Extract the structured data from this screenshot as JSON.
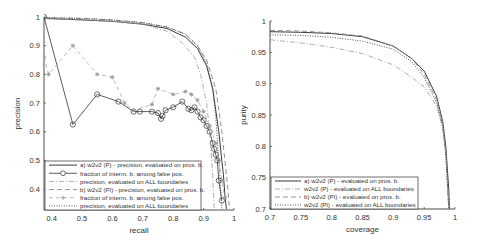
{
  "chart_data": [
    {
      "type": "line",
      "title": "",
      "xlabel": "recall",
      "ylabel": "precision",
      "xlim": [
        0.375,
        1.0
      ],
      "ylim": [
        0.327,
        1.0
      ],
      "xticks": [
        "0.4",
        "0.5",
        "0.6",
        "0.7",
        "0.8",
        "0.9",
        "1"
      ],
      "yticks": [
        "0.4",
        "0.5",
        "0.6",
        "0.7",
        "0.8",
        "0.9",
        "1"
      ],
      "grid": false,
      "legend_position": "lower left",
      "series": [
        {
          "name": "a) w2v2 (P) - precision, evaluated on pros. b.",
          "style": "solid",
          "x": [
            0.375,
            0.5,
            0.6,
            0.7,
            0.78,
            0.84,
            0.88,
            0.91,
            0.93,
            0.95,
            0.96,
            0.965,
            0.97,
            0.975
          ],
          "y": [
            0.995,
            0.99,
            0.985,
            0.975,
            0.96,
            0.93,
            0.89,
            0.83,
            0.75,
            0.6,
            0.5,
            0.45,
            0.38,
            0.33
          ]
        },
        {
          "name": "fraction of interm. b. among false pos.",
          "style": "solid-circle",
          "x": [
            0.375,
            0.47,
            0.55,
            0.62,
            0.67,
            0.69,
            0.73,
            0.75,
            0.76,
            0.765,
            0.775,
            0.8,
            0.83,
            0.85,
            0.86,
            0.87,
            0.88,
            0.89,
            0.9,
            0.91,
            0.92,
            0.93,
            0.935,
            0.94,
            0.945,
            0.95,
            0.96
          ],
          "y": [
            1.0,
            0.625,
            0.73,
            0.705,
            0.67,
            0.67,
            0.67,
            0.665,
            0.645,
            0.655,
            0.675,
            0.685,
            0.705,
            0.68,
            0.675,
            0.685,
            0.67,
            0.65,
            0.64,
            0.62,
            0.6,
            0.56,
            0.54,
            0.52,
            0.5,
            0.43,
            0.36
          ]
        },
        {
          "name": "precision, evaluated on ALL boundaries",
          "style": "dash-dot",
          "x": [
            0.375,
            0.5,
            0.6,
            0.7,
            0.78,
            0.83,
            0.87,
            0.89,
            0.91,
            0.92,
            0.93,
            0.935
          ],
          "y": [
            0.995,
            0.99,
            0.985,
            0.975,
            0.95,
            0.91,
            0.86,
            0.8,
            0.7,
            0.6,
            0.45,
            0.33
          ]
        },
        {
          "name": "b) w2v2 (PI) - precision, evaluated on pros. b.",
          "style": "dashed",
          "x": [
            0.375,
            0.5,
            0.6,
            0.7,
            0.78,
            0.84,
            0.88,
            0.91,
            0.94,
            0.96,
            0.97,
            0.98,
            0.985
          ],
          "y": [
            0.998,
            0.995,
            0.99,
            0.98,
            0.965,
            0.94,
            0.9,
            0.85,
            0.75,
            0.6,
            0.5,
            0.4,
            0.33
          ]
        },
        {
          "name": "fraction of interm. b. among false pos.",
          "style": "dashed-star",
          "x": [
            0.375,
            0.39,
            0.47,
            0.55,
            0.6,
            0.64,
            0.67,
            0.73,
            0.75,
            0.8,
            0.84,
            0.86,
            0.88,
            0.9,
            0.92,
            0.94,
            0.95,
            0.96,
            0.97
          ],
          "y": [
            0.86,
            0.8,
            0.9,
            0.8,
            0.79,
            0.7,
            0.675,
            0.695,
            0.75,
            0.73,
            0.74,
            0.73,
            0.71,
            0.67,
            0.62,
            0.56,
            0.5,
            0.43,
            0.37
          ]
        },
        {
          "name": "precision, evaluated on ALL boundaries",
          "style": "dotted",
          "x": [
            0.375,
            0.5,
            0.6,
            0.7,
            0.78,
            0.84,
            0.88,
            0.91,
            0.93,
            0.94,
            0.95,
            0.955,
            0.96
          ],
          "y": [
            0.998,
            0.995,
            0.99,
            0.98,
            0.965,
            0.94,
            0.9,
            0.84,
            0.75,
            0.65,
            0.5,
            0.42,
            0.33
          ]
        }
      ]
    },
    {
      "type": "line",
      "title": "",
      "xlabel": "coverage",
      "ylabel": "purity",
      "xlim": [
        0.7,
        1.0
      ],
      "ylim": [
        0.7,
        1.0
      ],
      "xticks": [
        "0.7",
        "0.75",
        "0.8",
        "0.85",
        "0.9",
        "0.95",
        "1"
      ],
      "yticks": [
        "0.7",
        "0.75",
        "0.8",
        "0.85",
        "0.9",
        "0.95",
        "1"
      ],
      "grid": false,
      "legend_position": "lower left",
      "series": [
        {
          "name": "a) w2v2 (P) - evaluated on pros. b.",
          "style": "solid",
          "x": [
            0.7,
            0.75,
            0.8,
            0.85,
            0.9,
            0.93,
            0.95,
            0.97,
            0.98,
            0.985,
            0.99,
            0.991
          ],
          "y": [
            0.983,
            0.982,
            0.98,
            0.975,
            0.96,
            0.94,
            0.92,
            0.88,
            0.84,
            0.8,
            0.73,
            0.7
          ]
        },
        {
          "name": "w2v2 (P) - evaluated on ALL boundaries",
          "style": "dash-dot",
          "x": [
            0.7,
            0.75,
            0.8,
            0.85,
            0.9,
            0.93,
            0.95,
            0.97,
            0.98,
            0.985,
            0.99
          ],
          "y": [
            0.97,
            0.965,
            0.958,
            0.948,
            0.93,
            0.91,
            0.895,
            0.865,
            0.83,
            0.79,
            0.7
          ]
        },
        {
          "name": "b) w2v2 (PI) - evaluated on pros. b.",
          "style": "dashed",
          "x": [
            0.7,
            0.75,
            0.8,
            0.85,
            0.9,
            0.93,
            0.95,
            0.97,
            0.98,
            0.985,
            0.99
          ],
          "y": [
            0.985,
            0.984,
            0.981,
            0.976,
            0.96,
            0.94,
            0.915,
            0.875,
            0.835,
            0.79,
            0.7
          ]
        },
        {
          "name": "w2v2 (PI) - evaluated on ALL boundaries",
          "style": "dotted",
          "x": [
            0.7,
            0.75,
            0.8,
            0.85,
            0.9,
            0.93,
            0.95,
            0.97,
            0.98,
            0.985,
            0.99
          ],
          "y": [
            0.978,
            0.977,
            0.974,
            0.968,
            0.955,
            0.935,
            0.91,
            0.87,
            0.83,
            0.785,
            0.7
          ]
        }
      ]
    }
  ],
  "left": {
    "xlabel": "recall",
    "ylabel": "precision",
    "legend": [
      "a) w2v2 (P) - precision, evaluated on pros. b.",
      "fraction of interm. b. among false pos.",
      "precision, evaluated on ALL boundaries",
      "b) w2v2 (PI) - precision, evaluated on pros. b.",
      "fraction of interm. b. among false pos.",
      "precision, evaluated on ALL boundaries"
    ]
  },
  "right": {
    "xlabel": "coverage",
    "ylabel": "purity",
    "legend": [
      "a) w2v2 (P) - evaluated on pros. b.",
      "w2v2 (P) - evaluated on ALL boundaries",
      "b) w2v2 (PI) - evaluated on pros. b.",
      "w2v2 (PI) - evaluated on ALL boundaries"
    ]
  }
}
